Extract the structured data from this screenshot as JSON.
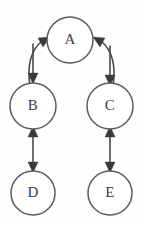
{
  "diagram": {
    "background_color": "#fefefe",
    "node_stroke_color": "#5c5c5c",
    "edge_color": "#4a4a4a",
    "label_color": "#3d3d3d",
    "nodes": [
      {
        "id": "A",
        "label": "A",
        "cx": 70,
        "cy": 40,
        "r": 23
      },
      {
        "id": "B",
        "label": "B",
        "cx": 33,
        "cy": 106,
        "r": 23
      },
      {
        "id": "C",
        "label": "C",
        "cx": 110,
        "cy": 106,
        "r": 23
      },
      {
        "id": "D",
        "label": "D",
        "cx": 33,
        "cy": 193,
        "r": 22
      },
      {
        "id": "E",
        "label": "E",
        "cx": 110,
        "cy": 193,
        "r": 22
      }
    ],
    "edges": [
      {
        "id": "b-to-a",
        "from": "B",
        "to": "A",
        "style": "curved",
        "arrow": "single"
      },
      {
        "id": "a-to-b",
        "from": "A",
        "to": "B",
        "style": "straight-vertical",
        "arrow": "single"
      },
      {
        "id": "c-to-a",
        "from": "C",
        "to": "A",
        "style": "curved",
        "arrow": "single"
      },
      {
        "id": "a-to-c",
        "from": "A",
        "to": "C",
        "style": "straight-vertical",
        "arrow": "single"
      },
      {
        "id": "b-e-d",
        "from": "B",
        "to": "D",
        "style": "straight-vertical",
        "arrow": "double"
      },
      {
        "id": "c-e-e",
        "from": "C",
        "to": "E",
        "style": "straight-vertical",
        "arrow": "double"
      }
    ]
  }
}
